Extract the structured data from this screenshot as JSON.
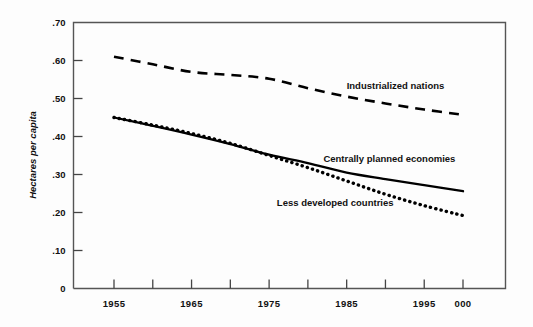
{
  "chart_data": {
    "type": "line",
    "title": "",
    "subtitle": "",
    "xlabel": "",
    "ylabel": "Hectares per capita",
    "xlim": [
      1955,
      2000
    ],
    "ylim": [
      0,
      0.7
    ],
    "grid": false,
    "legend_position": "inline-annotations",
    "y_ticks": [
      {
        "value": 0.7,
        "label": ".70"
      },
      {
        "value": 0.6,
        "label": ".60"
      },
      {
        "value": 0.5,
        "label": ".50"
      },
      {
        "value": 0.4,
        "label": ".40"
      },
      {
        "value": 0.3,
        "label": ".30"
      },
      {
        "value": 0.2,
        "label": ".20"
      },
      {
        "value": 0.1,
        "label": ".10"
      },
      {
        "value": 0.0,
        "label": "0"
      }
    ],
    "x_ticks": [
      {
        "value": 1955,
        "label": "1955",
        "labeled": true
      },
      {
        "value": 1960,
        "label": "",
        "labeled": false
      },
      {
        "value": 1965,
        "label": "1965",
        "labeled": true
      },
      {
        "value": 1970,
        "label": "",
        "labeled": false
      },
      {
        "value": 1975,
        "label": "1975",
        "labeled": true
      },
      {
        "value": 1980,
        "label": "",
        "labeled": false
      },
      {
        "value": 1985,
        "label": "1985",
        "labeled": true
      },
      {
        "value": 1990,
        "label": "",
        "labeled": false
      },
      {
        "value": 1995,
        "label": "1995",
        "labeled": true
      },
      {
        "value": 2000,
        "label": "000",
        "labeled": true
      }
    ],
    "x": [
      1955,
      1960,
      1965,
      1970,
      1975,
      1980,
      1985,
      1990,
      1995,
      2000
    ],
    "series": [
      {
        "name": "Industrialized nations",
        "style": "dashed",
        "color": "#000000",
        "values": [
          0.61,
          0.59,
          0.57,
          0.562,
          0.552,
          0.527,
          0.505,
          0.487,
          0.471,
          0.457
        ]
      },
      {
        "name": "Centrally planned economies",
        "style": "solid",
        "color": "#000000",
        "values": [
          0.45,
          0.428,
          0.405,
          0.38,
          0.352,
          0.33,
          0.305,
          0.288,
          0.272,
          0.256
        ]
      },
      {
        "name": "Less developed countries",
        "style": "dotted",
        "color": "#000000",
        "values": [
          0.45,
          0.43,
          0.408,
          0.382,
          0.35,
          0.318,
          0.283,
          0.248,
          0.218,
          0.192
        ]
      }
    ],
    "annotations": [
      {
        "text": "Industrialized nations",
        "x": 1985,
        "y": 0.525,
        "series": "Industrialized nations"
      },
      {
        "text": "Centrally planned economies",
        "x": 1982,
        "y": 0.333,
        "series": "Centrally planned economies"
      },
      {
        "text": "Less developed countries",
        "x": 1976,
        "y": 0.218,
        "series": "Less developed countries"
      }
    ]
  },
  "colors": {
    "ink": "#000000",
    "background": "#fdfdfd",
    "frame": "#555555"
  }
}
